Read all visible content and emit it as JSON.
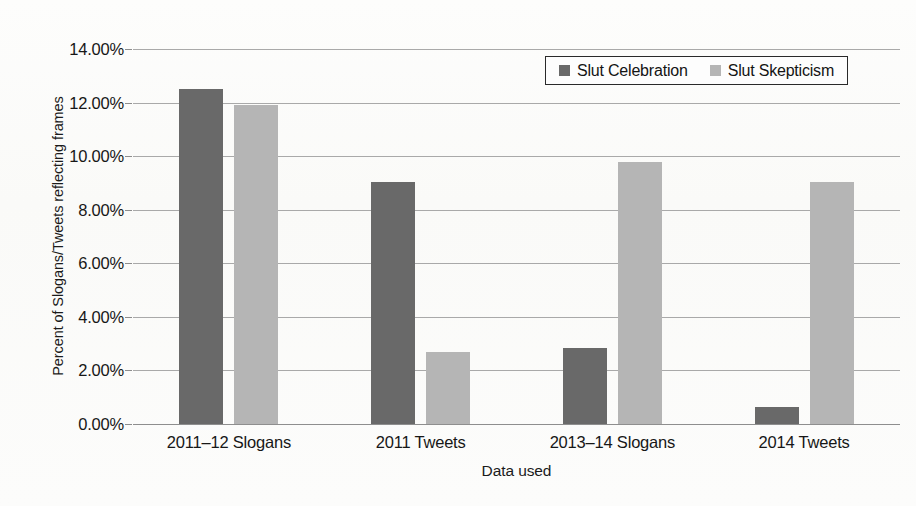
{
  "chart_data": {
    "type": "bar",
    "title": "",
    "xlabel": "Data used",
    "ylabel": "Percent of Slogans/Tweets reflecting frames",
    "categories": [
      "2011–12 Slogans",
      "2011 Tweets",
      "2013–14 Slogans",
      "2014 Tweets"
    ],
    "series": [
      {
        "name": "Slut Celebration",
        "color": "#696969",
        "values": [
          12.5,
          9.05,
          2.85,
          0.65
        ]
      },
      {
        "name": "Slut Skepticism",
        "color": "#b5b5b5",
        "values": [
          11.9,
          2.7,
          9.8,
          9.05
        ]
      }
    ],
    "ylim": [
      0,
      14
    ],
    "ytick_values": [
      14,
      12,
      10,
      8,
      6,
      4,
      2,
      0
    ],
    "ytick_labels": [
      "14.00%",
      "12.00%",
      "10.00%",
      "8.00%",
      "6.00%",
      "4.00%",
      "2.00%",
      "0.00%"
    ],
    "grid": true,
    "legend_position": "top-right",
    "value_format": "percent"
  },
  "legend": {
    "entries": [
      {
        "label": "Slut Celebration",
        "swatch": "legend-swatch-slut-celebration"
      },
      {
        "label": "Slut Skepticism",
        "swatch": "legend-swatch-slut-skepticism"
      }
    ]
  }
}
